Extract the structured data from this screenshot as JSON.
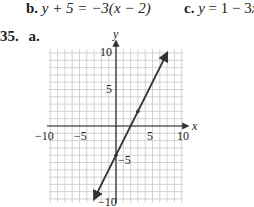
{
  "problems": {
    "b": {
      "label": "b.",
      "equation_lhs": "y + 5 = −3(",
      "equation_var": "x",
      "equation_rhs": " − 2)"
    },
    "c": {
      "label": "c.",
      "equation_lhs": "y",
      "equation_rhs": " = 1 − 3",
      "equation_var": "x"
    },
    "number": "35.",
    "part": "a."
  },
  "graph": {
    "x_axis_label": "x",
    "y_axis_label": "y",
    "x_ticks": [
      "−10",
      "−5",
      "5",
      "10"
    ],
    "y_ticks": [
      "10",
      "5",
      "−5",
      "−10"
    ],
    "line": {
      "slope": 2,
      "intercept": -4,
      "point1": [
        0,
        -4
      ],
      "point2": [
        3,
        2
      ]
    },
    "grid_color": "#c8c8c8",
    "line_color": "#333333"
  }
}
